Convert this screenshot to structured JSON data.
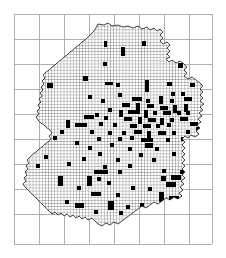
{
  "figure": {
    "kind": "distribution-map",
    "region": "Germany",
    "background_color": "#ffffff",
    "major_grid_color": "#a6a6a6",
    "mesh_grid_color": "#3c3c3c",
    "outline_color": "#1a1a1a",
    "record_color": "#000000",
    "caption": ""
  },
  "chart_data": {
    "type": "heatmap",
    "title": "",
    "subtitle": "",
    "xlabel": "",
    "ylabel": "",
    "legend": [],
    "annotations": [],
    "grid": true,
    "legend_position": "none",
    "cell_size_px": 3.1,
    "grid_origin_px": [
      14,
      14
    ],
    "plot_box_px": {
      "x": 14,
      "y": 14,
      "width": 198,
      "height": 230
    },
    "major_grid": {
      "color": "#a6a6a6",
      "spacing_px": 25,
      "vertical_lines_px": [
        14,
        39,
        64,
        89,
        114,
        139,
        164,
        189,
        212
      ],
      "horizontal_lines_px": [
        14,
        39,
        64,
        89,
        114,
        139,
        164,
        189,
        214,
        244
      ]
    },
    "categories": [],
    "values": [],
    "filled_cells_px": [
      [
        104,
        41,
        3,
        6
      ],
      [
        142,
        41,
        4,
        5
      ],
      [
        121,
        47,
        4,
        9
      ],
      [
        103,
        62,
        4,
        4
      ],
      [
        178,
        63,
        5,
        5
      ],
      [
        83,
        76,
        5,
        5
      ],
      [
        47,
        83,
        6,
        5
      ],
      [
        105,
        82,
        8,
        3
      ],
      [
        116,
        83,
        4,
        4
      ],
      [
        145,
        80,
        4,
        12
      ],
      [
        167,
        82,
        5,
        4
      ],
      [
        190,
        83,
        5,
        4
      ],
      [
        118,
        93,
        4,
        4
      ],
      [
        171,
        92,
        4,
        4
      ],
      [
        181,
        92,
        4,
        4
      ],
      [
        88,
        95,
        4,
        4
      ],
      [
        101,
        99,
        4,
        4
      ],
      [
        132,
        97,
        10,
        4
      ],
      [
        146,
        99,
        4,
        4
      ],
      [
        159,
        96,
        4,
        8
      ],
      [
        170,
        99,
        4,
        4
      ],
      [
        184,
        97,
        8,
        4
      ],
      [
        122,
        103,
        8,
        4
      ],
      [
        136,
        103,
        4,
        7
      ],
      [
        147,
        104,
        7,
        4
      ],
      [
        160,
        106,
        8,
        4
      ],
      [
        173,
        105,
        4,
        8
      ],
      [
        184,
        104,
        4,
        8
      ],
      [
        108,
        108,
        4,
        4
      ],
      [
        119,
        110,
        4,
        7
      ],
      [
        128,
        110,
        12,
        4
      ],
      [
        144,
        110,
        4,
        8
      ],
      [
        153,
        111,
        4,
        4
      ],
      [
        163,
        111,
        8,
        4
      ],
      [
        177,
        111,
        4,
        4
      ],
      [
        186,
        111,
        4,
        4
      ],
      [
        95,
        113,
        4,
        4
      ],
      [
        84,
        115,
        10,
        4
      ],
      [
        104,
        116,
        4,
        4
      ],
      [
        124,
        117,
        8,
        4
      ],
      [
        138,
        117,
        4,
        7
      ],
      [
        148,
        118,
        8,
        4
      ],
      [
        160,
        118,
        4,
        7
      ],
      [
        170,
        118,
        4,
        4
      ],
      [
        180,
        117,
        8,
        4
      ],
      [
        66,
        120,
        4,
        8
      ],
      [
        75,
        123,
        12,
        4
      ],
      [
        99,
        122,
        4,
        4
      ],
      [
        113,
        123,
        4,
        4
      ],
      [
        130,
        124,
        7,
        4
      ],
      [
        143,
        124,
        8,
        4
      ],
      [
        156,
        124,
        4,
        4
      ],
      [
        167,
        123,
        4,
        4
      ],
      [
        190,
        122,
        8,
        4
      ],
      [
        196,
        127,
        8,
        4
      ],
      [
        60,
        130,
        4,
        4
      ],
      [
        90,
        130,
        4,
        4
      ],
      [
        108,
        131,
        4,
        4
      ],
      [
        122,
        131,
        4,
        4
      ],
      [
        134,
        130,
        8,
        4
      ],
      [
        147,
        131,
        4,
        8
      ],
      [
        158,
        131,
        8,
        4
      ],
      [
        172,
        131,
        4,
        4
      ],
      [
        186,
        130,
        4,
        4
      ],
      [
        53,
        136,
        4,
        4
      ],
      [
        97,
        137,
        4,
        4
      ],
      [
        118,
        137,
        4,
        4
      ],
      [
        130,
        136,
        4,
        4
      ],
      [
        141,
        138,
        12,
        4
      ],
      [
        145,
        143,
        8,
        5
      ],
      [
        166,
        138,
        4,
        4
      ],
      [
        181,
        137,
        4,
        4
      ],
      [
        75,
        141,
        4,
        4
      ],
      [
        110,
        143,
        4,
        4
      ],
      [
        88,
        146,
        4,
        4
      ],
      [
        128,
        147,
        4,
        4
      ],
      [
        155,
        147,
        4,
        4
      ],
      [
        98,
        152,
        4,
        4
      ],
      [
        139,
        153,
        4,
        4
      ],
      [
        172,
        152,
        4,
        4
      ],
      [
        44,
        155,
        4,
        4
      ],
      [
        82,
        157,
        4,
        4
      ],
      [
        116,
        158,
        4,
        4
      ],
      [
        152,
        158,
        4,
        4
      ],
      [
        186,
        157,
        4,
        4
      ],
      [
        67,
        162,
        4,
        4
      ],
      [
        103,
        165,
        4,
        4
      ],
      [
        128,
        164,
        4,
        4
      ],
      [
        94,
        170,
        14,
        4
      ],
      [
        118,
        170,
        4,
        4
      ],
      [
        162,
        169,
        4,
        4
      ],
      [
        180,
        170,
        4,
        4
      ],
      [
        190,
        169,
        4,
        4
      ],
      [
        58,
        176,
        5,
        10
      ],
      [
        87,
        176,
        5,
        10
      ],
      [
        97,
        177,
        4,
        4
      ],
      [
        107,
        181,
        4,
        4
      ],
      [
        161,
        176,
        5,
        5
      ],
      [
        171,
        175,
        10,
        5
      ],
      [
        166,
        182,
        10,
        5
      ],
      [
        186,
        178,
        5,
        5
      ],
      [
        77,
        186,
        4,
        4
      ],
      [
        131,
        186,
        4,
        4
      ],
      [
        148,
        187,
        4,
        4
      ],
      [
        91,
        192,
        10,
        4
      ],
      [
        116,
        193,
        4,
        4
      ],
      [
        159,
        192,
        5,
        10
      ],
      [
        169,
        196,
        10,
        5
      ],
      [
        181,
        192,
        5,
        5
      ],
      [
        65,
        200,
        4,
        4
      ],
      [
        75,
        203,
        9,
        5
      ],
      [
        108,
        201,
        6,
        9
      ],
      [
        126,
        205,
        4,
        4
      ],
      [
        140,
        203,
        4,
        4
      ],
      [
        154,
        204,
        4,
        4
      ],
      [
        94,
        210,
        4,
        4
      ],
      [
        119,
        211,
        4,
        4
      ],
      [
        146,
        212,
        4,
        4
      ],
      [
        36,
        164,
        4,
        4
      ]
    ]
  }
}
